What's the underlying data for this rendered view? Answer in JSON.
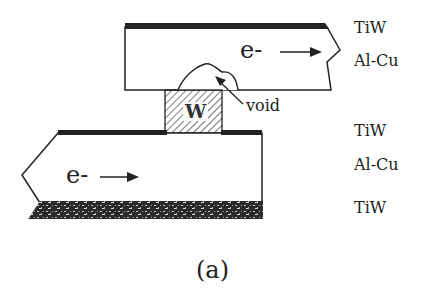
{
  "figure": {
    "caption": "(a)",
    "colors": {
      "line": "#222222",
      "tiw_fill": "#2a2a2a",
      "background": "#ffffff"
    }
  },
  "upper_line": {
    "electron_label": "e-",
    "arrow_direction": "right",
    "layers": [
      "TiW",
      "Al-Cu"
    ]
  },
  "via": {
    "material_label": "W",
    "fill_pattern": "diagonal-hatch"
  },
  "void": {
    "label": "void"
  },
  "lower_line": {
    "electron_label": "e-",
    "arrow_direction": "right",
    "layers": [
      "TiW",
      "Al-Cu",
      "TiW"
    ]
  },
  "layer_labels": [
    {
      "text": "TiW",
      "x": 354,
      "y": 20
    },
    {
      "text": "Al-Cu",
      "x": 354,
      "y": 53
    },
    {
      "text": "TiW",
      "x": 354,
      "y": 123
    },
    {
      "text": "Al-Cu",
      "x": 354,
      "y": 157
    },
    {
      "text": "TiW",
      "x": 354,
      "y": 200
    }
  ]
}
